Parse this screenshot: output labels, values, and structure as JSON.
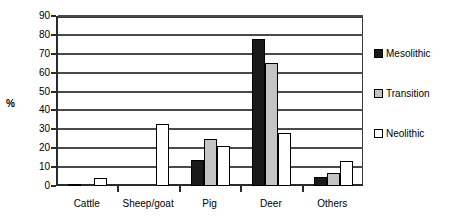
{
  "chart_data": {
    "type": "bar",
    "title": "",
    "subtitle": "",
    "xlabel": "",
    "ylabel": "%",
    "ylim": [
      0,
      90
    ],
    "ytick_step": 10,
    "yticks": [
      0,
      10,
      20,
      30,
      40,
      50,
      60,
      70,
      80,
      90
    ],
    "grid": true,
    "legend_position": "right",
    "categories": [
      "Cattle",
      "Sheep/goat",
      "Pig",
      "Deer",
      "Others"
    ],
    "series": [
      {
        "name": "Mesolithic",
        "color": "#1a1a1a",
        "values": [
          1,
          0,
          14,
          78,
          5
        ]
      },
      {
        "name": "Transition",
        "color": "#c4c4c4",
        "values": [
          0,
          0,
          25,
          65,
          7
        ]
      },
      {
        "name": "Neolithic",
        "color": "#ffffff",
        "values": [
          4,
          33,
          21,
          28,
          13
        ]
      }
    ]
  },
  "legend": {
    "items": [
      {
        "label": "Mesolithic"
      },
      {
        "label": "Transition"
      },
      {
        "label": "Neolithic"
      }
    ]
  }
}
